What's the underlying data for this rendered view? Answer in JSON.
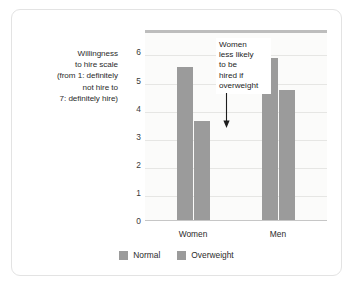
{
  "chart_data": {
    "type": "bar",
    "title": "",
    "xlabel": "",
    "ylabel": "Willingness to hire scale (from 1: definitely not hire to 7: definitely hire)",
    "ylabel_lines": [
      "Willingness",
      "to hire scale",
      "(from 1: definitely",
      "not hire to",
      "7: definitely hire)"
    ],
    "categories": [
      "Women",
      "Men"
    ],
    "series": [
      {
        "name": "Normal",
        "values": [
          5.5,
          5.8
        ],
        "color": "#9b9b9b"
      },
      {
        "name": "Overweight",
        "values": [
          3.55,
          4.68
        ],
        "color": "#9b9b9b"
      }
    ],
    "ylim": [
      0,
      6.8
    ],
    "yticks": [
      0,
      1,
      2,
      3,
      4,
      5,
      6
    ],
    "ytick_labels": [
      "0",
      "1",
      "2",
      "3",
      "4",
      "5",
      "6"
    ],
    "grid": true,
    "legend_position": "bottom",
    "annotations": [
      {
        "text": "Women less likely to be hired if overweight",
        "lines": [
          "Women",
          "less likely",
          "to be",
          "hired if",
          "overweight"
        ],
        "arrow": "down-arrow",
        "points_to": "women-overweight-bar"
      }
    ]
  },
  "colors": {
    "bar": "#9b9b9b",
    "plot_background": "#fbfbfa",
    "gridline": "#e6e6e4",
    "card_border": "#e3e3e3",
    "plot_top_border": "#bdbdbd",
    "axis": "#c6c6c6",
    "text": "#2b2b2b"
  }
}
